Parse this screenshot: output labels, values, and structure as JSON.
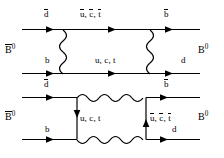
{
  "figure": {
    "caption": "",
    "line_color": "#000000",
    "background": "#ffffff"
  },
  "diagrams": [
    {
      "id": "box-diagram-top",
      "type": "feynman-box",
      "description": "Box diagram with vertical W boson propagators",
      "left_state": "B̅0",
      "right_state": "B0",
      "labels": {
        "top_left": "d̅",
        "top_mid": "u̅, c̅, t̅",
        "top_right": "b̅",
        "bottom_left": "b",
        "bottom_mid": "u, c, t",
        "bottom_right": "d"
      }
    },
    {
      "id": "box-diagram-bottom",
      "type": "feynman-box",
      "description": "Box diagram with horizontal W boson propagators",
      "left_state": "B̅0",
      "right_state": "B0",
      "labels": {
        "top_left": "d̅",
        "top_right": "b̅",
        "bottom_left": "b",
        "bottom_right": "d",
        "left_vertical": "u, c, t",
        "right_vertical": "u̅, c̅, t̅"
      }
    }
  ],
  "text": {
    "d_bar": "d",
    "b_bar": "b",
    "b": "b",
    "d": "d",
    "u_c_t": "u, c, t",
    "ubar_cbar_tbar_u": "u",
    "ubar_cbar_tbar_c": "c",
    "ubar_cbar_tbar_t": "t",
    "comma": ", ",
    "B": "B",
    "zero": "0"
  }
}
